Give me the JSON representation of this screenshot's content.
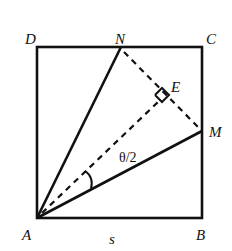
{
  "diagram": {
    "type": "geometry",
    "colors": {
      "stroke": "#111111",
      "background": "#ffffff"
    },
    "labels": {
      "D": "D",
      "N": "N",
      "C": "C",
      "E": "E",
      "M": "M",
      "A": "A",
      "B": "B",
      "side": "s",
      "angle": "θ/2"
    },
    "points": {
      "A": [
        37,
        218
      ],
      "B": [
        202,
        218
      ],
      "C": [
        202,
        47
      ],
      "D": [
        37,
        47
      ],
      "N": [
        121,
        47
      ],
      "M": [
        202,
        131
      ],
      "E": [
        162,
        98
      ]
    },
    "solid_segments": [
      "AB",
      "BC",
      "CD",
      "DA",
      "AN",
      "AM"
    ],
    "dashed_segments": [
      "NM",
      "AE"
    ],
    "right_angle_at": "E",
    "angle_marks": [
      {
        "vertex": "A",
        "between": [
          "AE",
          "AM"
        ],
        "label": "θ/2"
      }
    ]
  }
}
